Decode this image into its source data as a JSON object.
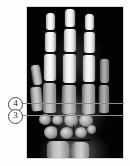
{
  "figure": {
    "background_color": "#ffffff",
    "image_background_color": "#050505",
    "marker_line_color": "#8e8e8e",
    "badge_border_color": "#4a4a4a"
  },
  "scan": {
    "modality_label": "hand-radiograph",
    "view": "coronal",
    "alt": "Grayscale radiograph of a human hand showing phalanges, metacarpals and carpal bones"
  },
  "markers": [
    {
      "id": "marker-4",
      "label": "4",
      "line_y": 103,
      "badge_y": 97
    },
    {
      "id": "marker-3",
      "label": "3",
      "line_y": 115,
      "badge_y": 109
    }
  ]
}
